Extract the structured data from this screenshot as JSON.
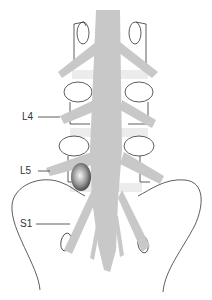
{
  "figure": {
    "type": "anatomical illustration",
    "colors": {
      "nerve": "#c8c8c8",
      "outline": "#333333",
      "disc_band": "#ececec",
      "herniation_dark": "#555555",
      "herniation_light": "#f4f4f4"
    }
  },
  "labels": [
    {
      "id": "l4",
      "text": "L4"
    },
    {
      "id": "l5",
      "text": "L5"
    },
    {
      "id": "s1",
      "text": "S1"
    }
  ]
}
